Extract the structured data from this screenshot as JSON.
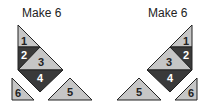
{
  "colors": {
    "light": "#c6c6c6",
    "dark": "#3a3a3a",
    "light_text": "#222222",
    "dark_text": "#ffffff"
  },
  "figures": [
    {
      "title": "Make 6",
      "pieces": [
        {
          "label": "1",
          "shade": "light"
        },
        {
          "label": "2",
          "shade": "dark"
        },
        {
          "label": "3",
          "shade": "light"
        },
        {
          "label": "4",
          "shade": "dark"
        },
        {
          "label": "5",
          "shade": "light"
        },
        {
          "label": "6",
          "shade": "light"
        }
      ]
    },
    {
      "title": "Make 6",
      "pieces": [
        {
          "label": "1",
          "shade": "light"
        },
        {
          "label": "2",
          "shade": "dark"
        },
        {
          "label": "3",
          "shade": "light"
        },
        {
          "label": "4",
          "shade": "dark"
        },
        {
          "label": "5",
          "shade": "light"
        },
        {
          "label": "6",
          "shade": "light"
        }
      ]
    }
  ]
}
